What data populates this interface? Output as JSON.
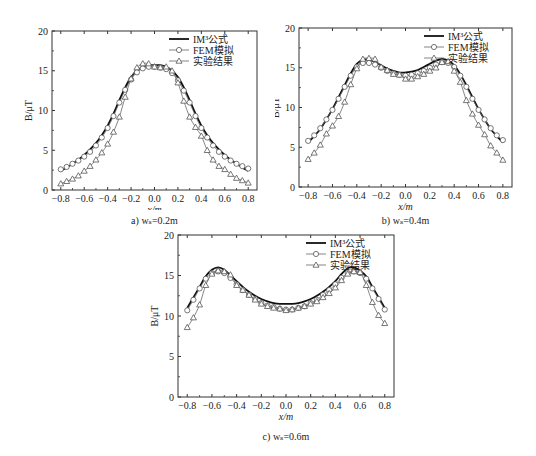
{
  "legend": {
    "formula": "IM³公式",
    "fem": "FEM模拟",
    "experiment": "实验结果"
  },
  "chart_data": [
    {
      "type": "line",
      "id": "a",
      "caption": "a) wₛ=0.2m",
      "title": "",
      "xlabel": "x/m",
      "ylabel": "B/μT",
      "xlim": [
        -0.8,
        0.8
      ],
      "ylim": [
        0,
        20
      ],
      "xticks": [
        "-0.8",
        "-0.6",
        "-0.4",
        "-0.2",
        "0.0",
        "0.2",
        "0.4",
        "0.6",
        "0.8"
      ],
      "yticks": [
        "0",
        "5",
        "10",
        "15",
        "20"
      ],
      "grid": false,
      "legend_position": "upper right",
      "x": [
        -0.8,
        -0.75,
        -0.7,
        -0.65,
        -0.6,
        -0.55,
        -0.5,
        -0.45,
        -0.4,
        -0.35,
        -0.3,
        -0.25,
        -0.2,
        -0.15,
        -0.1,
        -0.05,
        0.0,
        0.05,
        0.1,
        0.15,
        0.2,
        0.25,
        0.3,
        0.35,
        0.4,
        0.45,
        0.5,
        0.55,
        0.6,
        0.65,
        0.7,
        0.75,
        0.8
      ],
      "series": [
        {
          "name": "IM³公式",
          "marker": "none",
          "values": [
            2.4,
            2.8,
            3.3,
            3.8,
            4.4,
            5.1,
            5.9,
            6.9,
            8.1,
            9.6,
            11.3,
            12.9,
            14.2,
            15.0,
            15.5,
            15.7,
            15.7,
            15.7,
            15.5,
            15.0,
            14.2,
            12.9,
            11.3,
            9.6,
            8.1,
            6.9,
            5.9,
            5.1,
            4.4,
            3.8,
            3.3,
            2.8,
            2.4
          ]
        },
        {
          "name": "FEM模拟",
          "marker": "circle",
          "values": [
            2.6,
            2.9,
            3.3,
            3.7,
            4.2,
            4.8,
            5.6,
            6.6,
            7.8,
            9.3,
            11.0,
            12.6,
            13.9,
            14.8,
            15.3,
            15.5,
            15.5,
            15.4,
            15.2,
            14.7,
            13.8,
            12.5,
            11.0,
            9.3,
            7.8,
            6.6,
            5.6,
            4.8,
            4.2,
            3.7,
            3.3,
            3.0,
            2.7
          ]
        },
        {
          "name": "实验结果",
          "marker": "triangle",
          "values": [
            0.8,
            1.1,
            1.4,
            1.8,
            2.4,
            3.0,
            3.8,
            4.7,
            5.8,
            7.3,
            9.2,
            11.7,
            14.0,
            15.4,
            15.9,
            15.9,
            15.5,
            15.4,
            15.5,
            15.0,
            13.5,
            11.2,
            9.2,
            7.9,
            6.8,
            5.0,
            3.8,
            3.0,
            2.6,
            2.0,
            1.5,
            1.2,
            0.9
          ]
        }
      ]
    },
    {
      "type": "line",
      "id": "b",
      "caption": "b) wₛ=0.4m",
      "title": "",
      "xlabel": "x/m",
      "ylabel": "B/μT",
      "xlim": [
        -0.8,
        0.8
      ],
      "ylim": [
        0,
        20
      ],
      "xticks": [
        "-0.8",
        "-0.6",
        "-0.4",
        "-0.2",
        "0.0",
        "0.2",
        "0.4",
        "0.6",
        "0.8"
      ],
      "yticks": [
        "0",
        "5",
        "10",
        "15",
        "20"
      ],
      "grid": false,
      "legend_position": "upper right",
      "x": [
        -0.8,
        -0.75,
        -0.7,
        -0.65,
        -0.6,
        -0.55,
        -0.5,
        -0.45,
        -0.4,
        -0.35,
        -0.3,
        -0.25,
        -0.2,
        -0.15,
        -0.1,
        -0.05,
        0.0,
        0.05,
        0.1,
        0.15,
        0.2,
        0.25,
        0.3,
        0.35,
        0.4,
        0.45,
        0.5,
        0.55,
        0.6,
        0.65,
        0.7,
        0.75,
        0.8
      ],
      "series": [
        {
          "name": "IM³公式",
          "marker": "none",
          "values": [
            5.6,
            6.4,
            7.3,
            8.5,
            9.8,
            11.3,
            12.8,
            14.3,
            15.5,
            16.0,
            16.0,
            15.7,
            15.3,
            14.9,
            14.6,
            14.4,
            14.4,
            14.5,
            14.7,
            15.1,
            15.5,
            15.9,
            16.1,
            15.9,
            15.3,
            14.2,
            12.8,
            11.3,
            9.8,
            8.5,
            7.3,
            6.4,
            5.6
          ]
        },
        {
          "name": "FEM模拟",
          "marker": "circle",
          "values": [
            5.8,
            6.5,
            7.4,
            8.5,
            9.7,
            11.1,
            12.6,
            14.0,
            15.1,
            15.6,
            15.6,
            15.4,
            15.0,
            14.6,
            14.3,
            14.1,
            14.0,
            14.1,
            14.3,
            14.6,
            15.0,
            15.4,
            15.7,
            15.6,
            15.1,
            14.0,
            12.6,
            11.1,
            9.7,
            8.5,
            7.4,
            6.5,
            5.9
          ]
        },
        {
          "name": "实验结果",
          "marker": "triangle",
          "values": [
            3.5,
            4.3,
            5.3,
            6.7,
            7.7,
            8.9,
            10.7,
            12.9,
            14.9,
            16.1,
            16.2,
            16.1,
            15.1,
            14.7,
            14.2,
            14.1,
            13.6,
            13.6,
            13.9,
            14.2,
            14.6,
            15.0,
            15.7,
            15.8,
            14.6,
            13.2,
            10.9,
            9.2,
            7.8,
            6.6,
            5.2,
            4.3,
            3.4
          ]
        }
      ]
    },
    {
      "type": "line",
      "id": "c",
      "caption": "c) wₛ=0.6m",
      "title": "",
      "xlabel": "x/m",
      "ylabel": "B/μT",
      "xlim": [
        -0.8,
        0.8
      ],
      "ylim": [
        0,
        20
      ],
      "xticks": [
        "-0.8",
        "-0.6",
        "-0.4",
        "-0.2",
        "0.0",
        "0.2",
        "0.4",
        "0.6",
        "0.8"
      ],
      "yticks": [
        "0",
        "5",
        "10",
        "15",
        "20"
      ],
      "grid": false,
      "legend_position": "upper right",
      "x": [
        -0.8,
        -0.75,
        -0.7,
        -0.65,
        -0.6,
        -0.55,
        -0.5,
        -0.45,
        -0.4,
        -0.35,
        -0.3,
        -0.25,
        -0.2,
        -0.15,
        -0.1,
        -0.05,
        0.0,
        0.05,
        0.1,
        0.15,
        0.2,
        0.25,
        0.3,
        0.35,
        0.4,
        0.45,
        0.5,
        0.55,
        0.6,
        0.65,
        0.7,
        0.75,
        0.8
      ],
      "series": [
        {
          "name": "IM³公式",
          "marker": "none",
          "values": [
            11.0,
            12.3,
            13.6,
            14.9,
            15.7,
            16.0,
            15.7,
            15.0,
            14.3,
            13.6,
            13.0,
            12.5,
            12.1,
            11.8,
            11.6,
            11.5,
            11.5,
            11.5,
            11.6,
            11.8,
            12.1,
            12.5,
            13.0,
            13.6,
            14.3,
            15.2,
            15.9,
            16.0,
            15.6,
            14.9,
            13.6,
            12.3,
            11.0
          ]
        },
        {
          "name": "FEM模拟",
          "marker": "circle",
          "values": [
            10.7,
            12.0,
            13.4,
            14.6,
            15.3,
            15.5,
            15.3,
            14.7,
            13.9,
            13.2,
            12.6,
            12.1,
            11.6,
            11.3,
            11.1,
            10.9,
            10.8,
            10.8,
            11.0,
            11.2,
            11.6,
            12.0,
            12.6,
            13.2,
            13.9,
            14.7,
            15.3,
            15.5,
            15.3,
            14.6,
            13.4,
            12.1,
            10.8
          ]
        },
        {
          "name": "实验结果",
          "marker": "triangle",
          "values": [
            8.6,
            9.8,
            11.4,
            13.8,
            15.2,
            15.6,
            15.5,
            15.1,
            13.8,
            13.2,
            12.6,
            12.0,
            11.5,
            11.2,
            11.0,
            10.9,
            10.7,
            10.8,
            11.0,
            11.2,
            11.5,
            11.8,
            12.3,
            12.8,
            13.5,
            14.4,
            15.2,
            15.5,
            15.4,
            13.8,
            11.7,
            10.1,
            9.1
          ]
        }
      ]
    }
  ],
  "layout": {
    "panels": [
      {
        "left": 10,
        "top": 8,
        "plot_left": 42,
        "plot_top": 23,
        "plot_w": 205,
        "plot_h": 159
      },
      {
        "left": 275,
        "top": 8,
        "plot_left": 24,
        "plot_top": 20,
        "plot_w": 213,
        "plot_h": 159
      },
      {
        "left": 140,
        "top": 226,
        "plot_left": 38,
        "plot_top": 9,
        "plot_w": 216,
        "plot_h": 162
      }
    ]
  }
}
